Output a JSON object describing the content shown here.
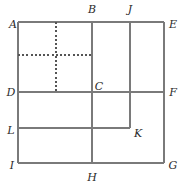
{
  "figure": {
    "type": "geometry-diagram",
    "title": "",
    "canvas": {
      "width": 188,
      "height": 191
    },
    "style": {
      "solid_stroke": "#7a7a7a",
      "dashed_stroke": "#555555",
      "label_color": "#2b2b2b",
      "background": "#ffffff",
      "solid_width": 1.6,
      "dashed_width": 1.1,
      "dash_pattern": "2,2.2"
    },
    "points": {
      "A": {
        "label": "A",
        "x": 18,
        "y": 22,
        "lx": 13,
        "ly": 24
      },
      "B": {
        "label": "B",
        "x": 92,
        "y": 22,
        "lx": 92,
        "ly": 9
      },
      "J": {
        "label": "J",
        "x": 130,
        "y": 22,
        "lx": 130,
        "ly": 9
      },
      "E": {
        "label": "E",
        "x": 164,
        "y": 22,
        "lx": 173,
        "ly": 24
      },
      "D": {
        "label": "D",
        "x": 18,
        "y": 92,
        "lx": 11,
        "ly": 92
      },
      "C": {
        "label": "C",
        "x": 92,
        "y": 92,
        "lx": 99,
        "ly": 86
      },
      "F": {
        "label": "F",
        "x": 164,
        "y": 92,
        "lx": 173,
        "ly": 92
      },
      "L": {
        "label": "L",
        "x": 18,
        "y": 128,
        "lx": 11,
        "ly": 130
      },
      "K": {
        "label": "K",
        "x": 130,
        "y": 128,
        "lx": 138,
        "ly": 133
      },
      "I": {
        "label": "I",
        "x": 18,
        "y": 163,
        "lx": 12,
        "ly": 165
      },
      "H": {
        "label": "H",
        "x": 92,
        "y": 163,
        "lx": 92,
        "ly": 177
      },
      "G": {
        "label": "G",
        "x": 164,
        "y": 163,
        "lx": 173,
        "ly": 165
      }
    },
    "solid_segments": [
      {
        "name": "top-edge-A-E",
        "x1": 18,
        "y1": 22,
        "x2": 164,
        "y2": 22
      },
      {
        "name": "right-edge-E-G",
        "x1": 164,
        "y1": 22,
        "x2": 164,
        "y2": 163
      },
      {
        "name": "bottom-edge-I-G",
        "x1": 18,
        "y1": 163,
        "x2": 164,
        "y2": 163
      },
      {
        "name": "left-edge-A-I",
        "x1": 18,
        "y1": 22,
        "x2": 18,
        "y2": 163
      },
      {
        "name": "vertical-B-H",
        "x1": 92,
        "y1": 22,
        "x2": 92,
        "y2": 163
      },
      {
        "name": "vertical-J-K",
        "x1": 130,
        "y1": 22,
        "x2": 130,
        "y2": 128
      },
      {
        "name": "horizontal-D-F",
        "x1": 18,
        "y1": 92,
        "x2": 164,
        "y2": 92
      },
      {
        "name": "horizontal-L-K",
        "x1": 18,
        "y1": 128,
        "x2": 130,
        "y2": 128
      }
    ],
    "dashed_segments": [
      {
        "name": "dashed-horizontal",
        "x1": 18,
        "y1": 55,
        "x2": 92,
        "y2": 55
      },
      {
        "name": "dashed-vertical",
        "x1": 56,
        "y1": 22,
        "x2": 56,
        "y2": 92
      }
    ]
  }
}
